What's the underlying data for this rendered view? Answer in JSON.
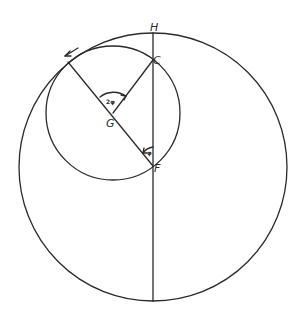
{
  "diagram": {
    "points": {
      "H": "H",
      "C": "C",
      "G": "G",
      "F": "F"
    },
    "angles": {
      "at_G": "2φ",
      "at_F": "φ"
    },
    "colors": {
      "ink": "#2a2a2a",
      "background": "#ffffff"
    },
    "geometry": {
      "large_circle": {
        "cx": 153,
        "cy": 167,
        "r": 134
      },
      "small_circle": {
        "cx": 113,
        "cy": 113,
        "r": 67
      },
      "vertical_line": {
        "x": 153,
        "y1": 33,
        "y2": 301
      },
      "arrow_direction": "counter-clockwise"
    }
  }
}
